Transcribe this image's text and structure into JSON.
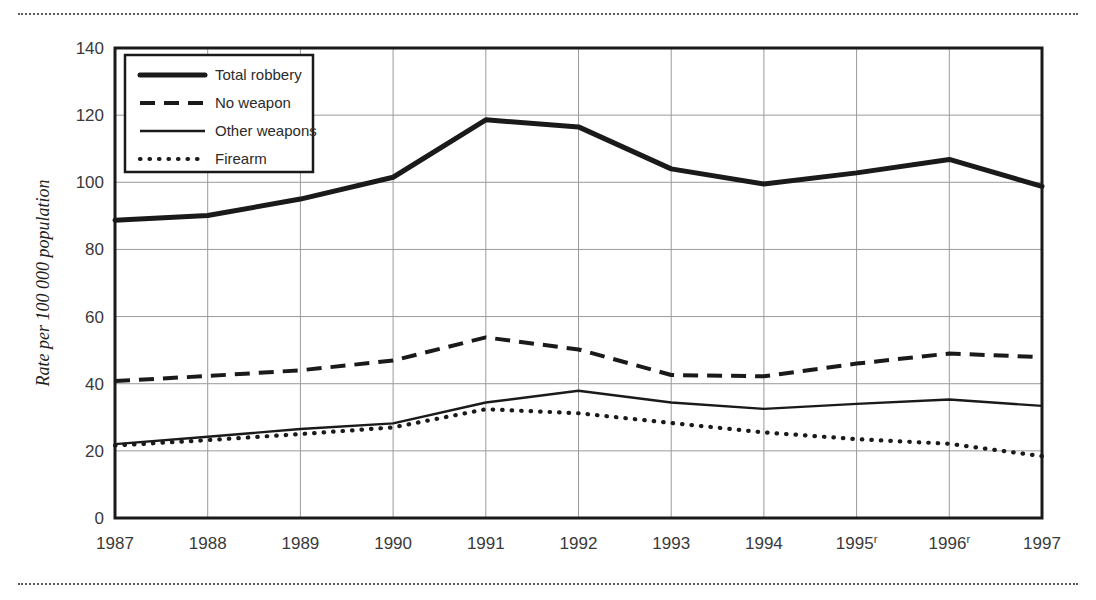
{
  "chart_data": {
    "type": "line",
    "title": "",
    "xlabel": "",
    "ylabel": "Rate per 100 000 population",
    "categories": [
      "1987",
      "1988",
      "1989",
      "1990",
      "1991",
      "1992",
      "1993",
      "1994",
      "1995",
      "1996",
      "1997"
    ],
    "category_labels": [
      "1987",
      "1988",
      "1989",
      "1990",
      "1991",
      "1992",
      "1993",
      "1994",
      "1995ʳ",
      "1996ʳ",
      "1997"
    ],
    "category_superscripts": [
      "",
      "",
      "",
      "",
      "",
      "",
      "",
      "",
      "r",
      "r",
      ""
    ],
    "ylim": [
      0,
      140
    ],
    "yticks": [
      0,
      20,
      40,
      60,
      80,
      100,
      120,
      140
    ],
    "grid": true,
    "legend_position": "top-left",
    "series": [
      {
        "name": "Total robbery",
        "style": "thick-solid",
        "values": [
          88.7,
          90.1,
          95.0,
          101.5,
          118.6,
          116.5,
          104.0,
          99.5,
          102.8,
          106.8,
          98.8
        ]
      },
      {
        "name": "No weapon",
        "style": "dashed",
        "values": [
          40.8,
          42.3,
          44.0,
          46.9,
          53.8,
          50.2,
          42.6,
          42.2,
          46.0,
          49.0,
          47.9
        ]
      },
      {
        "name": "Other weapons",
        "style": "thin-solid",
        "values": [
          22.0,
          24.2,
          26.5,
          28.2,
          34.4,
          37.9,
          34.4,
          32.5,
          34.0,
          35.3,
          33.4
        ]
      },
      {
        "name": "Firearm",
        "style": "dotted",
        "values": [
          21.6,
          23.2,
          25.0,
          27.0,
          32.4,
          31.2,
          28.3,
          25.5,
          23.5,
          22.1,
          18.4
        ]
      }
    ]
  },
  "legend": {
    "items": [
      {
        "label": "Total robbery",
        "style": "thick-solid"
      },
      {
        "label": "No weapon",
        "style": "dashed"
      },
      {
        "label": "Other weapons",
        "style": "thin-solid"
      },
      {
        "label": "Firearm",
        "style": "dotted"
      }
    ]
  },
  "colors": {
    "ink": "#1a1a1a",
    "gridline": "#9a9a9a",
    "tick_text": "#3a3a3a",
    "rule": "#5b5b5b",
    "background": "#ffffff"
  },
  "rules": {
    "top": "dotted-divider",
    "bottom": "dotted-divider"
  }
}
